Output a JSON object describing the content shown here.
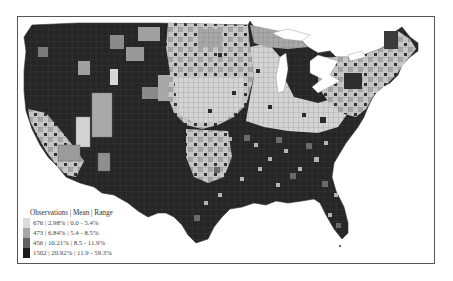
{
  "map": {
    "title": "",
    "region": "Contiguous United States (county level)",
    "colors": {
      "class1": "#dcdcdc",
      "class2": "#a6a6a6",
      "class3": "#616161",
      "class4": "#1c1c1c",
      "border": "#555555",
      "water": "#ffffff"
    }
  },
  "legend": {
    "title": "Observations | Mean | Range",
    "items": [
      {
        "label": "676 | 2.98% | 0.0 - 5.4%",
        "observations": 676,
        "mean": "2.98%",
        "range": "0.0 - 5.4%",
        "color": "#dcdcdc"
      },
      {
        "label": "473 | 6.84% | 5.4 - 8.5%",
        "observations": 473,
        "mean": "6.84%",
        "range": "5.4 - 8.5%",
        "color": "#a6a6a6"
      },
      {
        "label": "456 | 10.21% | 8.5 - 11.9%",
        "observations": 456,
        "mean": "10.21%",
        "range": "8.5 - 11.9%",
        "color": "#616161"
      },
      {
        "label": "1502 | 20.92% | 11.9 - 59.3%",
        "observations": 1502,
        "mean": "20.92%",
        "range": "11.9 - 59.3%",
        "color": "#1c1c1c"
      }
    ]
  }
}
